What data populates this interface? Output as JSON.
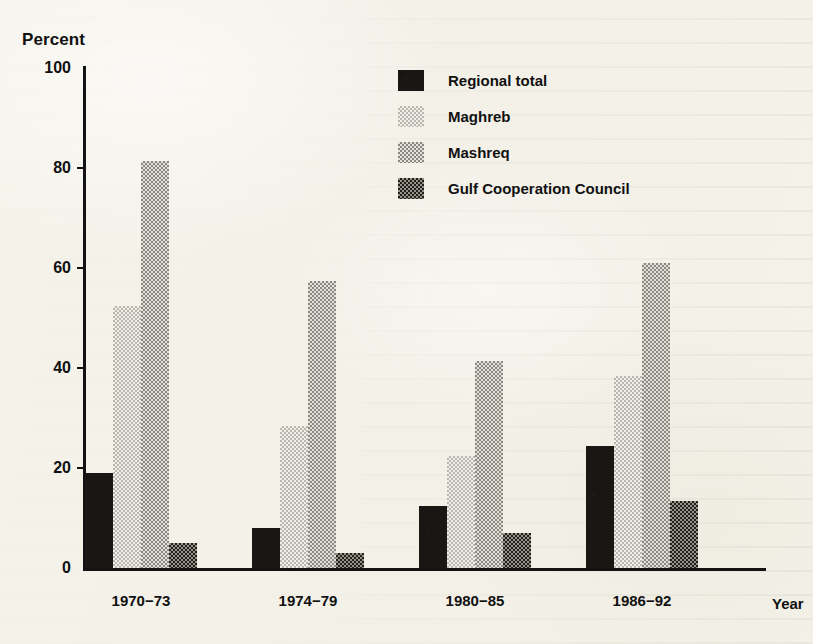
{
  "chart_data": {
    "type": "bar",
    "title": "",
    "subtitle": "",
    "xlabel": "Year",
    "ylabel": "Percent",
    "categories": [
      "1970−73",
      "1974−79",
      "1980−85",
      "1986−92"
    ],
    "ylim": [
      0,
      100
    ],
    "yticks": [
      0,
      20,
      40,
      60,
      80,
      100
    ],
    "ytick_labels": [
      "0",
      "20",
      "40",
      "60",
      "80",
      "100"
    ],
    "grid": false,
    "legend_position": "top-center-right",
    "series": [
      {
        "name": "Regional total",
        "pattern": "solid-black",
        "color": "#1a1613",
        "values": [
          19,
          8,
          12.5,
          24.5
        ]
      },
      {
        "name": "Maghreb",
        "pattern": "light-halftone",
        "color": "#e7e5dd",
        "values": [
          52.5,
          28.5,
          22.5,
          38.5
        ]
      },
      {
        "name": "Mashreq",
        "pattern": "medium-halftone",
        "color": "#cfcdc4",
        "values": [
          81.5,
          57.5,
          41.5,
          61
        ]
      },
      {
        "name": "Gulf Cooperation Council",
        "pattern": "dark-halftone",
        "color": "#5d5a52",
        "values": [
          5,
          3,
          7,
          13.5
        ]
      }
    ]
  },
  "legend": {
    "items": [
      {
        "label": "Regional total"
      },
      {
        "label": "Maghreb"
      },
      {
        "label": "Mashreq"
      },
      {
        "label": "Gulf Cooperation Council"
      }
    ]
  }
}
